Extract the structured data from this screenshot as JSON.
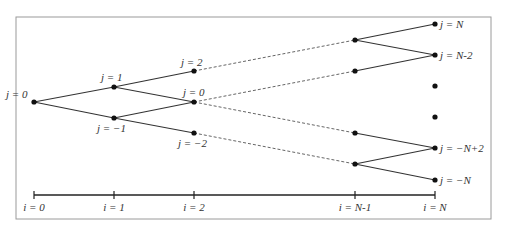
{
  "diagram": {
    "type": "binomial-tree",
    "frame": {
      "x": 16,
      "y": 17,
      "w": 475,
      "h": 202,
      "stroke": "#9a9a9a"
    },
    "nodes": [
      {
        "id": "n0_0",
        "x": 34,
        "y": 102,
        "label": "j = 0",
        "lx": 6,
        "ly": 98
      },
      {
        "id": "n1_1",
        "x": 114,
        "y": 87,
        "label": "j = 1",
        "lx": 101,
        "ly": 81
      },
      {
        "id": "n1_m1",
        "x": 114,
        "y": 118,
        "label": "j = −1",
        "lx": 97,
        "ly": 132
      },
      {
        "id": "n2_2",
        "x": 194,
        "y": 71,
        "label": "j = 2",
        "lx": 181,
        "ly": 66
      },
      {
        "id": "n2_0",
        "x": 194,
        "y": 102,
        "label": "j = 0",
        "lx": 183,
        "ly": 96
      },
      {
        "id": "n2_m2",
        "x": 194,
        "y": 133,
        "label": "j = −2",
        "lx": 178,
        "ly": 147
      },
      {
        "id": "nN1_a",
        "x": 355,
        "y": 40,
        "label": "",
        "lx": 0,
        "ly": 0
      },
      {
        "id": "nN1_b",
        "x": 355,
        "y": 71,
        "label": "",
        "lx": 0,
        "ly": 0
      },
      {
        "id": "nN1_c",
        "x": 355,
        "y": 133,
        "label": "",
        "lx": 0,
        "ly": 0
      },
      {
        "id": "nN1_d",
        "x": 355,
        "y": 164,
        "label": "",
        "lx": 0,
        "ly": 0
      },
      {
        "id": "nN_N",
        "x": 435,
        "y": 24,
        "label": "j = N",
        "lx": 440,
        "ly": 28
      },
      {
        "id": "nN_N2",
        "x": 435,
        "y": 55,
        "label": "j = N-2",
        "lx": 440,
        "ly": 59
      },
      {
        "id": "dot1",
        "x": 435,
        "y": 86,
        "label": "",
        "lx": 0,
        "ly": 0
      },
      {
        "id": "dot2",
        "x": 435,
        "y": 117,
        "label": "",
        "lx": 0,
        "ly": 0
      },
      {
        "id": "nN_mN2",
        "x": 435,
        "y": 148,
        "label": "j = −N+2",
        "lx": 440,
        "ly": 152
      },
      {
        "id": "nN_mN",
        "x": 435,
        "y": 180,
        "label": "j = −N",
        "lx": 440,
        "ly": 184
      }
    ],
    "solid_edges": [
      [
        34,
        102,
        114,
        87
      ],
      [
        34,
        102,
        114,
        118
      ],
      [
        114,
        87,
        194,
        71
      ],
      [
        114,
        87,
        194,
        102
      ],
      [
        114,
        118,
        194,
        102
      ],
      [
        114,
        118,
        194,
        133
      ],
      [
        355,
        40,
        435,
        24
      ],
      [
        355,
        40,
        435,
        55
      ],
      [
        355,
        71,
        435,
        55
      ],
      [
        355,
        133,
        435,
        148
      ],
      [
        355,
        164,
        435,
        148
      ],
      [
        355,
        164,
        435,
        180
      ]
    ],
    "dashed_edges": [
      [
        194,
        71,
        355,
        40
      ],
      [
        194,
        102,
        355,
        71
      ],
      [
        194,
        102,
        355,
        133
      ],
      [
        194,
        133,
        355,
        164
      ]
    ],
    "axis": {
      "y": 195,
      "x1": 34,
      "x2": 435,
      "ticks": [
        {
          "x": 34,
          "label": "i = 0"
        },
        {
          "x": 114,
          "label": "i = 1"
        },
        {
          "x": 194,
          "label": "i = 2"
        },
        {
          "x": 355,
          "label": "i = N-1"
        },
        {
          "x": 435,
          "label": "i = N"
        }
      ]
    }
  }
}
